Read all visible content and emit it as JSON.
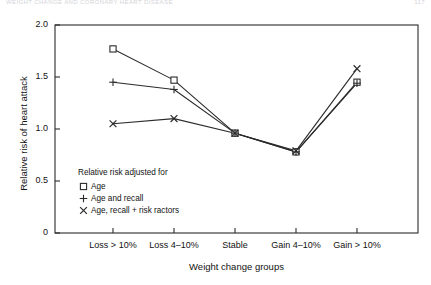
{
  "page": {
    "running_head_left": "WEIGHT CHANGE AND CORONARY HEART DISEASE",
    "running_head_right": "117"
  },
  "chart_data": {
    "type": "line",
    "title": "",
    "xlabel": "Weight change groups",
    "ylabel": "Relative risk of heart attack",
    "categories": [
      "Loss > 10%",
      "Loss 4–10%",
      "Stable",
      "Gain 4–10%",
      "Gain > 10%"
    ],
    "ylim": [
      0,
      2.0
    ],
    "yticks": [
      0,
      0.5,
      1.0,
      1.5,
      2.0
    ],
    "ytick_labels": [
      "0",
      "0.5",
      "1.0",
      "1.5",
      "2.0"
    ],
    "grid": false,
    "legend_position": "inside-lower-left",
    "legend_title": "Relative risk adjusted for",
    "series": [
      {
        "name": "Age",
        "marker": "open-square",
        "values": [
          1.77,
          1.47,
          0.96,
          0.78,
          1.45
        ]
      },
      {
        "name": "Age and recall",
        "marker": "plus",
        "values": [
          1.45,
          1.38,
          0.96,
          0.78,
          1.44
        ]
      },
      {
        "name": "Age, recall + risk ractors",
        "marker": "cross",
        "values": [
          1.05,
          1.1,
          0.96,
          0.79,
          1.58
        ]
      }
    ]
  },
  "colors": {
    "line": "#2b2b2b",
    "axis": "#2b2b2b",
    "text": "#121212"
  }
}
